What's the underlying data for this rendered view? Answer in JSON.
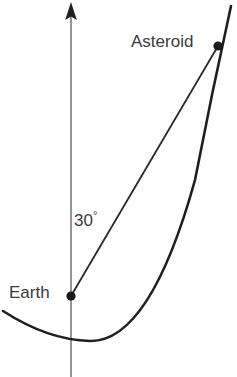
{
  "diagram": {
    "background_color": "#ffffff",
    "labels": {
      "asteroid": "Asteroid",
      "earth": "Earth",
      "angle_value": "30",
      "angle_unit": "°",
      "angle_full": "30°"
    },
    "colors": {
      "axis": "#7a7a7a",
      "curve": "#1f1f1f",
      "sight_line": "#2a2a2a",
      "point": "#1a1a1a",
      "text": "#3a3a3a"
    },
    "points": [
      {
        "name": "earth",
        "label": "Earth",
        "x": 71,
        "y": 296
      },
      {
        "name": "asteroid",
        "label": "Asteroid",
        "x": 218,
        "y": 46
      }
    ],
    "axis": {
      "name": "vertical-axis",
      "orientation": "vertical",
      "x": 71,
      "y_top": 2,
      "y_bottom": 377,
      "arrow": "up"
    },
    "orbit_curve": {
      "name": "asteroid-orbit",
      "shape": "parabolic",
      "start": {
        "x": 3,
        "y": 311
      },
      "vertex": {
        "x": 90,
        "y": 341
      },
      "through_asteroid": {
        "x": 218,
        "y": 46
      },
      "end": {
        "x": 231,
        "y": 6
      }
    },
    "sight_line": {
      "name": "earth-asteroid-line",
      "from": {
        "x": 71,
        "y": 296
      },
      "to": {
        "x": 218,
        "y": 46
      },
      "angle_from_axis_degrees": 30
    }
  }
}
